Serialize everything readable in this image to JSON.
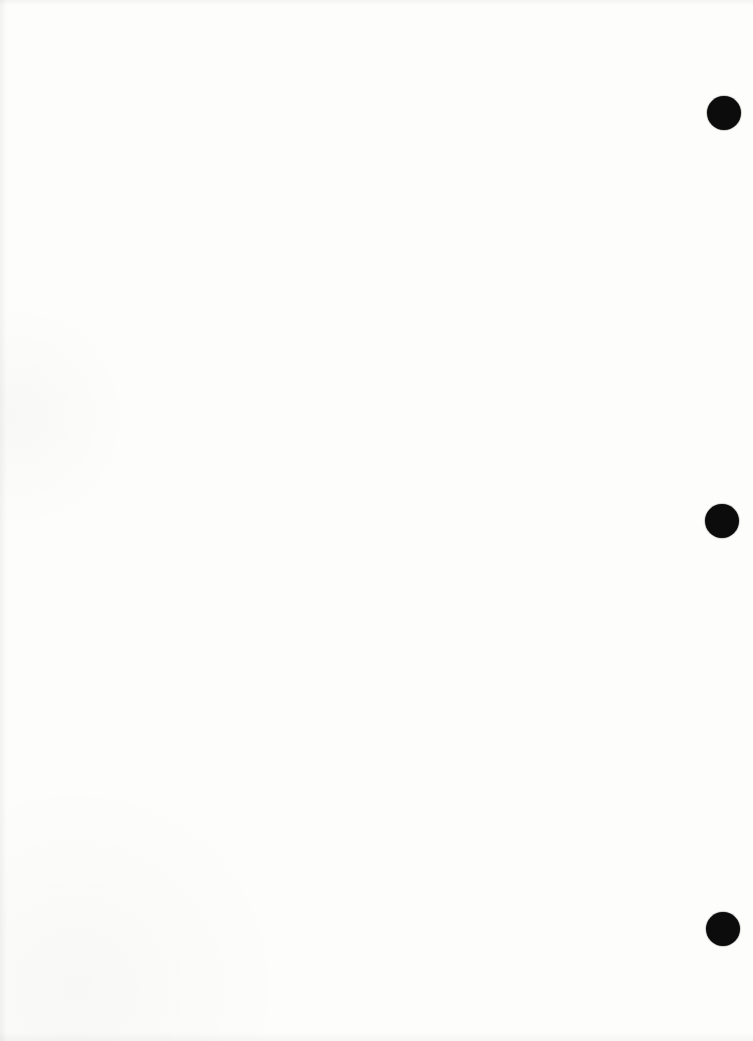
{
  "page": {
    "kind": "blank-scanned-document-page",
    "background_color": "#fdfdfc",
    "text_content": ""
  },
  "punch_holes": {
    "color": "#0c0c0c",
    "diameter_px": 34,
    "marks": [
      {
        "cx": 724,
        "cy": 113
      },
      {
        "cx": 722,
        "cy": 521
      },
      {
        "cx": 723,
        "cy": 929
      }
    ]
  }
}
